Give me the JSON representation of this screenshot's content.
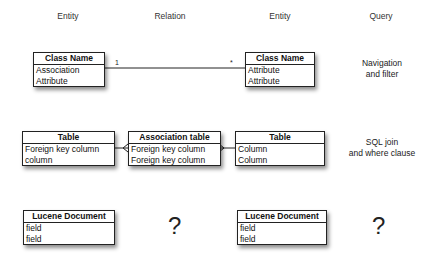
{
  "columns": [
    "Entity",
    "Relation",
    "Entity",
    "Query"
  ],
  "rows": [
    {
      "left_entity": {
        "title": "Class Name",
        "fields": [
          "Association",
          "Attribute"
        ]
      },
      "relation": {
        "multiplicity_left": "1",
        "multiplicity_right": "*"
      },
      "right_entity": {
        "title": "Class Name",
        "fields": [
          "Attribute",
          "Attribute"
        ]
      },
      "query": [
        "Navigation",
        "and filter"
      ]
    },
    {
      "left_entity": {
        "title": "Table",
        "fields": [
          "Foreign key column",
          "column"
        ]
      },
      "relation": {
        "title": "Association table",
        "fields": [
          "Foreign key column",
          "Foreign key column"
        ]
      },
      "right_entity": {
        "title": "Table",
        "fields": [
          "Column",
          "Column"
        ]
      },
      "query": [
        "SQL join",
        "and where clause"
      ]
    },
    {
      "left_entity": {
        "title": "Lucene Document",
        "fields": [
          "field",
          "field"
        ]
      },
      "relation": {
        "unknown": "?"
      },
      "right_entity": {
        "title": "Lucene Document",
        "fields": [
          "field",
          "field"
        ]
      },
      "query": [
        "?"
      ]
    }
  ]
}
